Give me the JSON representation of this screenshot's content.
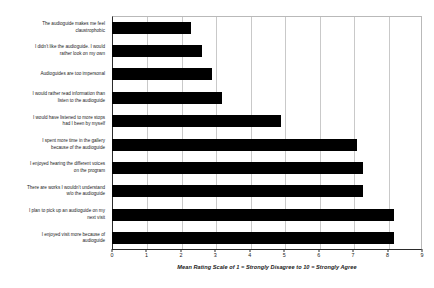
{
  "chart_data": {
    "type": "bar",
    "orientation": "horizontal",
    "title": "",
    "xlabel": "Mean Rating Scale of 1 = Strongly Disagree to 10 = Strongly Agree",
    "ylabel": "",
    "xlim": [
      0,
      9
    ],
    "xticks": [
      0,
      1,
      2,
      3,
      4,
      5,
      6,
      7,
      8,
      9
    ],
    "grid": true,
    "grid_axis": "x",
    "legend": false,
    "bar_color": "#000000",
    "categories": [
      "The audioguide makes me feel claustrophobic",
      "I didn't like the audioguide. I would rather look on my own",
      "Audioguides are too impersonal",
      "I would rather read information than listen to the audioguide",
      "I would have listened to more stops had I been by myself",
      "I spent more time in the gallery because of the audioguide",
      "I enjoyed hearing the different voices on the program",
      "There are works I wouldn't understand w/o the audioguide",
      "I plan to pick up an audioguide on my next visit",
      "I enjoyed visit more because of audioguide"
    ],
    "category_lines": [
      [
        "The audioguide makes me feel",
        "claustrophobic"
      ],
      [
        "I didn't like the audioguide. I would",
        "rather look on my own"
      ],
      [
        "Audioguides are too impersonal"
      ],
      [
        "I would rather read information than",
        "listen to the audioguide"
      ],
      [
        "I would have listened to more stops",
        "had I been by myself"
      ],
      [
        "I spent more time in the gallery",
        "because of the audioguide"
      ],
      [
        "I enjoyed hearing the different voices",
        "on the program"
      ],
      [
        "There are works I wouldn't understand",
        "w/o the audioguide"
      ],
      [
        "I plan to pick up an audioguide on my",
        "next visit"
      ],
      [
        "I enjoyed visit more because of",
        "audioguide"
      ]
    ],
    "values": [
      2.3,
      2.6,
      2.9,
      3.2,
      4.9,
      7.1,
      7.3,
      7.3,
      8.2,
      8.2
    ]
  }
}
